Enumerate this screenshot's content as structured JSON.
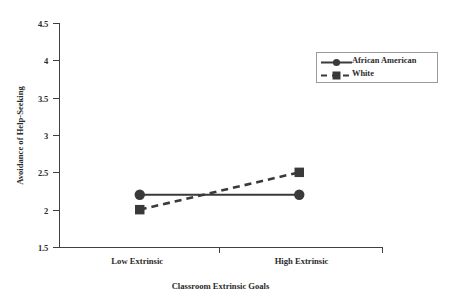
{
  "chart_data": {
    "type": "line",
    "title": "",
    "subtitle": "",
    "xlabel": "Classroom Extrinsic Goals",
    "ylabel": "Avoidance of Help-Seeking",
    "categories": [
      "Low Extrinsic",
      "High Extrinsic"
    ],
    "ylim": [
      1.5,
      4.5
    ],
    "ytick_labels": [
      "1.5",
      "2",
      "2.5",
      "3",
      "3.5",
      "4",
      "4.5"
    ],
    "ytick_values": [
      1.5,
      2,
      2.5,
      3,
      3.5,
      4,
      4.5
    ],
    "grid": false,
    "legend_position": "top-right",
    "series": [
      {
        "name": "African American",
        "values": [
          2.2,
          2.2
        ],
        "line_style": "solid",
        "marker": "circle",
        "color": "#3a3a3a"
      },
      {
        "name": "White",
        "values": [
          2.0,
          2.5
        ],
        "line_style": "dashed",
        "marker": "square",
        "color": "#3a3a3a"
      }
    ]
  },
  "axes": {
    "y_title": "Avoidance of Help-Seeking",
    "x_title": "Classroom Extrinsic Goals",
    "y_ticks": [
      {
        "label": "4.5"
      },
      {
        "label": "4"
      },
      {
        "label": "3.5"
      },
      {
        "label": "3"
      },
      {
        "label": "2.5"
      },
      {
        "label": "2"
      },
      {
        "label": "1.5"
      }
    ],
    "x_ticks": [
      {
        "label": "Low Extrinsic"
      },
      {
        "label": "High Extrinsic"
      }
    ]
  },
  "legend": {
    "items": [
      {
        "label": "African American"
      },
      {
        "label": "White"
      }
    ]
  },
  "colors": {
    "axis": "#404040",
    "series": "#3a3a3a",
    "legend_border": "#9a9a9a",
    "text": "#2b2b2b",
    "background": "#ffffff"
  }
}
